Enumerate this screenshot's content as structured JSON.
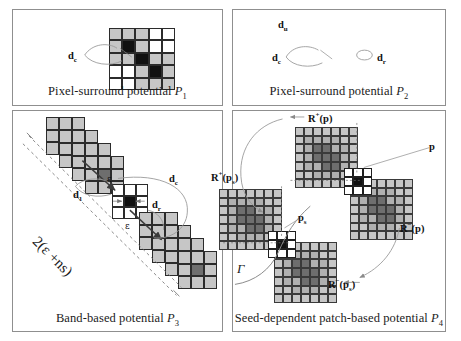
{
  "figure": {
    "panels": [
      {
        "id": "P1",
        "caption_text": "Pixel-surround potential",
        "caption_symbol": "P",
        "caption_subscript": "1",
        "grid": {
          "rows": 5,
          "cols": 5,
          "cells": [
            [
              "light",
              "light",
              "light",
              "white",
              "white"
            ],
            [
              "light",
              "black",
              "light",
              "white",
              "white"
            ],
            [
              "light",
              "light",
              "black",
              "light",
              "light"
            ],
            [
              "white",
              "white",
              "light",
              "black",
              "light"
            ],
            [
              "white",
              "white",
              "light",
              "light",
              "light"
            ]
          ]
        },
        "labels": [
          {
            "name": "d-c-label",
            "text": "d",
            "sub": "c"
          }
        ]
      },
      {
        "id": "P2",
        "caption_text": "Pixel-surround potential",
        "caption_symbol": "P",
        "caption_subscript": "2",
        "grid": {
          "rows": 5,
          "cols": 5,
          "cells": [
            [
              "light",
              "light",
              "light",
              "white",
              "white"
            ],
            [
              "light",
              "black",
              "light",
              "white",
              "white"
            ],
            [
              "light",
              "light",
              "black",
              "light",
              "light"
            ],
            [
              "white",
              "white",
              "light",
              "black",
              "light"
            ],
            [
              "white",
              "white",
              "light",
              "light",
              "light"
            ]
          ]
        },
        "labels": [
          {
            "name": "d-u-label",
            "text": "d",
            "sub": "u"
          },
          {
            "name": "d-c-label",
            "text": "d",
            "sub": "c"
          },
          {
            "name": "d-r-label",
            "text": "d",
            "sub": "r"
          }
        ]
      },
      {
        "id": "P3",
        "caption_text": "Band-based potential",
        "caption_symbol": "P",
        "caption_subscript": "3",
        "labels": [
          {
            "name": "d-1-label",
            "text": "d",
            "sub": "1"
          },
          {
            "name": "d-c-label",
            "text": "d",
            "sub": "c"
          },
          {
            "name": "d-r-label",
            "text": "d",
            "sub": "r"
          },
          {
            "name": "epsilon-upper",
            "text": "ε"
          },
          {
            "name": "epsilon-lower",
            "text": "ε"
          },
          {
            "name": "band-width-label",
            "text": "2(ε +ns)"
          }
        ]
      },
      {
        "id": "P4",
        "caption_text": "Seed-dependent patch-based potential",
        "caption_symbol": "P",
        "caption_subscript": "4",
        "labels": [
          {
            "name": "r-plus-p-label",
            "text": "R",
            "sup": "+",
            "arg": "(p)"
          },
          {
            "name": "r-minus-p-label",
            "text": "R",
            "sup": "−",
            "arg": "(p)"
          },
          {
            "name": "r-plus-ps-label",
            "text": "R",
            "sup": "+",
            "arg": "(p",
            "argsub": "s",
            "argend": ")"
          },
          {
            "name": "r-minus-ps-label",
            "text": "R",
            "sup": "−",
            "arg": "(p",
            "argsub": "s",
            "argend": ")"
          },
          {
            "name": "p-label",
            "text": "p"
          },
          {
            "name": "ps-label",
            "text": "p",
            "sub": "s"
          },
          {
            "name": "gamma-label",
            "text": "Γ"
          }
        ]
      }
    ],
    "colors": {
      "cell_white": "#ffffff",
      "cell_light_gray": "#c6c6c6",
      "cell_mid_gray": "#b0b0b0",
      "cell_dark_gray": "#6e6e6e",
      "cell_black": "#111111",
      "panel_border": "#8f8f8f",
      "arrow": "#3b3b3b",
      "bracket_curve": "#9a9a9a",
      "dashed_line": "#6a6a6a",
      "background": "#ffffff"
    }
  }
}
